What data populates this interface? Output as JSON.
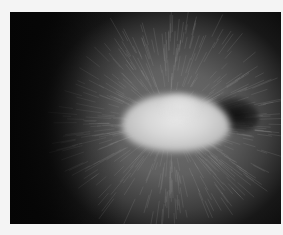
{
  "image": {
    "description": "Grayscale photograph of a radial fibrous (mycelium-like) growth with a bright central mass and a dark shadow to its right",
    "tones": {
      "background": "#0a0a0a",
      "fibers": "#7a7a7a",
      "blob": "#dcdcdc",
      "shadow": "#111111",
      "page": "#f4f4f4"
    }
  }
}
